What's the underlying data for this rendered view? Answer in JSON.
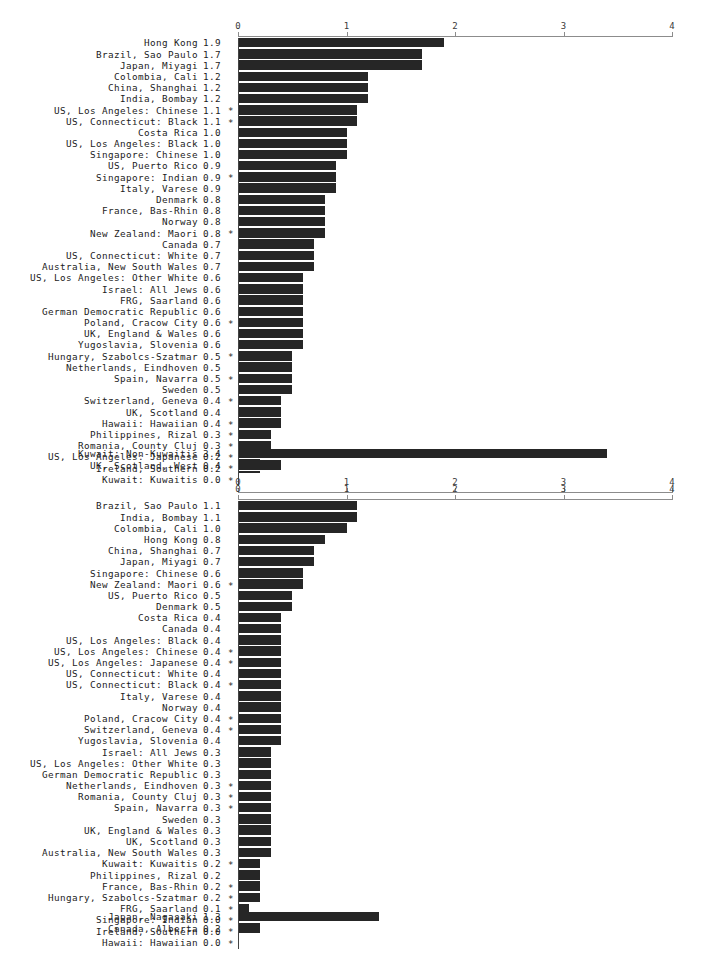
{
  "chart_data": [
    {
      "type": "bar",
      "title": "",
      "xlabel": "",
      "ylabel": "",
      "orientation": "horizontal",
      "xlim": [
        0,
        4
      ],
      "xticks": [
        0,
        1,
        2,
        3,
        4
      ],
      "xticklabels": [
        "0",
        "1",
        "2",
        "3",
        "4"
      ],
      "grid": false,
      "legend": null,
      "axis_top": true,
      "axis_bottom": true,
      "categories": [
        "Hong Kong",
        "Brazil, Sao Paulo",
        "Japan, Miyagi",
        "Colombia, Cali",
        "China, Shanghai",
        "India, Bombay",
        "US, Los Angeles: Chinese",
        "US, Connecticut: Black",
        "Costa Rica",
        "US, Los Angeles: Black",
        "Singapore: Chinese",
        "US, Puerto Rico",
        "Singapore: Indian",
        "Italy, Varese",
        "Denmark",
        "France, Bas-Rhin",
        "Norway",
        "New Zealand: Maori",
        "Canada",
        "US, Connecticut: White",
        "Australia, New South Wales",
        "US, Los Angeles: Other White",
        "Israel: All Jews",
        "FRG, Saarland",
        "German Democratic Republic",
        "Poland, Cracow City",
        "UK, England & Wales",
        "Yugoslavia, Slovenia",
        "Hungary, Szabolcs-Szatmar",
        "Netherlands, Eindhoven",
        "Spain, Navarra",
        "Sweden",
        "Switzerland, Geneva",
        "UK, Scotland",
        "Hawaii: Hawaiian",
        "Philippines, Rizal",
        "Romania, County Cluj",
        "US, Los Angeles: Japanese",
        "Ireland, Southern",
        "Kuwait: Kuwaitis"
      ],
      "values": [
        1.9,
        1.7,
        1.7,
        1.2,
        1.2,
        1.2,
        1.1,
        1.1,
        1.0,
        1.0,
        1.0,
        0.9,
        0.9,
        0.9,
        0.8,
        0.8,
        0.8,
        0.8,
        0.7,
        0.7,
        0.7,
        0.6,
        0.6,
        0.6,
        0.6,
        0.6,
        0.6,
        0.6,
        0.5,
        0.5,
        0.5,
        0.5,
        0.4,
        0.4,
        0.4,
        0.3,
        0.3,
        0.2,
        0.2,
        0.0
      ],
      "flags": [
        false,
        false,
        false,
        false,
        false,
        false,
        true,
        true,
        false,
        false,
        false,
        false,
        true,
        false,
        false,
        false,
        false,
        true,
        false,
        false,
        false,
        false,
        false,
        false,
        false,
        true,
        false,
        false,
        true,
        false,
        true,
        false,
        true,
        false,
        true,
        true,
        true,
        true,
        true,
        true
      ],
      "extra_categories": [
        "Kuwait: Non-Kuwaitis",
        "UK, Scotland, West"
      ],
      "extra_values": [
        3.4,
        0.4
      ],
      "extra_flags": [
        false,
        false
      ]
    },
    {
      "type": "bar",
      "title": "",
      "xlabel": "",
      "ylabel": "",
      "orientation": "horizontal",
      "xlim": [
        0,
        4
      ],
      "xticks": [
        0,
        1,
        2,
        3,
        4
      ],
      "xticklabels": [
        "0",
        "1",
        "2",
        "3",
        "4"
      ],
      "grid": false,
      "legend": null,
      "axis_top": true,
      "axis_bottom": false,
      "categories": [
        "Brazil, Sao Paulo",
        "India, Bombay",
        "Colombia, Cali",
        "Hong Kong",
        "China, Shanghai",
        "Japan, Miyagi",
        "Singapore: Chinese",
        "New Zealand: Maori",
        "US, Puerto Rico",
        "Denmark",
        "Costa Rica",
        "Canada",
        "US, Los Angeles: Black",
        "US, Los Angeles: Chinese",
        "US, Los Angeles: Japanese",
        "US, Connecticut: White",
        "US, Connecticut: Black",
        "Italy, Varese",
        "Norway",
        "Poland, Cracow City",
        "Switzerland, Geneva",
        "Yugoslavia, Slovenia",
        "Israel: All Jews",
        "US, Los Angeles: Other White",
        "German Democratic Republic",
        "Netherlands, Eindhoven",
        "Romania, County Cluj",
        "Spain, Navarra",
        "Sweden",
        "UK, England & Wales",
        "UK, Scotland",
        "Australia, New South Wales",
        "Kuwait: Kuwaitis",
        "Philippines, Rizal",
        "France, Bas-Rhin",
        "Hungary, Szabolcs-Szatmar",
        "FRG, Saarland",
        "Singapore: Indian",
        "Ireland, Southern",
        "Hawaii: Hawaiian"
      ],
      "values": [
        1.1,
        1.1,
        1.0,
        0.8,
        0.7,
        0.7,
        0.6,
        0.6,
        0.5,
        0.5,
        0.4,
        0.4,
        0.4,
        0.4,
        0.4,
        0.4,
        0.4,
        0.4,
        0.4,
        0.4,
        0.4,
        0.4,
        0.3,
        0.3,
        0.3,
        0.3,
        0.3,
        0.3,
        0.3,
        0.3,
        0.3,
        0.3,
        0.2,
        0.2,
        0.2,
        0.2,
        0.1,
        0.0,
        0.0,
        0.0
      ],
      "flags": [
        false,
        false,
        false,
        false,
        false,
        false,
        false,
        true,
        false,
        false,
        false,
        false,
        false,
        true,
        true,
        false,
        true,
        false,
        false,
        true,
        true,
        false,
        false,
        false,
        false,
        true,
        true,
        true,
        false,
        false,
        false,
        false,
        true,
        false,
        true,
        true,
        true,
        true,
        true,
        true
      ],
      "extra_categories": [
        "Japan, Nagasaki",
        "Canada, Alberta"
      ],
      "extra_values": [
        1.3,
        0.2
      ],
      "extra_flags": [
        false,
        false
      ]
    }
  ],
  "style": {
    "bar_color": "#262626",
    "axis_color": "#8c8c8c",
    "text_color": "#1c1c1c",
    "background": "#ffffff",
    "flag_glyph": "*"
  }
}
